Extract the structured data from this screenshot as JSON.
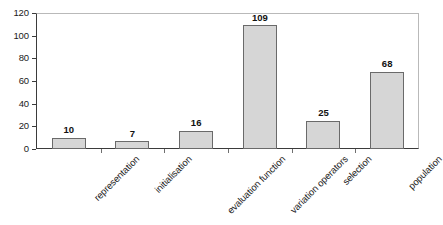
{
  "chart_data": {
    "type": "bar",
    "title": "",
    "xlabel": "",
    "ylabel": "",
    "categories": [
      "representation",
      "initialisation",
      "evaluation function",
      "variation operators",
      "selection",
      "population"
    ],
    "values": [
      10,
      7,
      16,
      109,
      25,
      68
    ],
    "value_labels": [
      "10",
      "7",
      "16",
      "109",
      "25",
      "68"
    ],
    "ylim": [
      0,
      120
    ],
    "ytick_labels": [
      "0",
      "20",
      "40",
      "60",
      "80",
      "100",
      "120"
    ],
    "ytick_values": [
      0,
      20,
      40,
      60,
      80,
      100,
      120
    ],
    "grid": false,
    "legend": false,
    "legend_position": "none",
    "bar_fill_color": "#d6d6d6",
    "bar_border_color": "#6a6a6a",
    "axis_color": "#3b3b3b",
    "frame_color": "#b9b9b9",
    "text_color": "#1a1a1a",
    "background_color": "#ffffff",
    "x_label_rotation_degrees": -45
  }
}
